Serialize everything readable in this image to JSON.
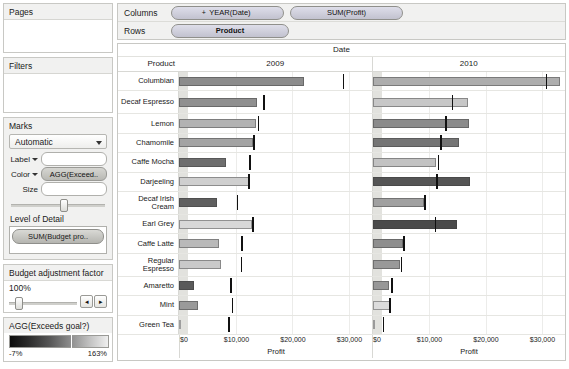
{
  "sidebar": {
    "pages": {
      "title": "Pages"
    },
    "filters": {
      "title": "Filters"
    },
    "marks": {
      "title": "Marks",
      "mark_type": "Automatic",
      "label_shelf_label": "Label",
      "label_shelf_value": "",
      "color_shelf_label": "Color",
      "color_shelf_value": "AGG(Exceed..",
      "size_shelf_label": "Size",
      "size_shelf_value": "",
      "level_of_detail_title": "Level of Detail",
      "level_of_detail_pill": "SUM(Budget pro.."
    },
    "parameter": {
      "title": "Budget adjustment factor",
      "value": "100%",
      "prev_label": "◂",
      "next_label": "▸"
    },
    "legend": {
      "title": "AGG(Exceeds goal?)",
      "min": "-7%",
      "max": "163%",
      "gradient_dark": "#0d0d0d",
      "gradient_light": "#efefef"
    }
  },
  "shelves": {
    "columns_label": "Columns",
    "columns_pills": [
      "YEAR(Date)",
      "SUM(Profit)"
    ],
    "columns_pill_plus": "+",
    "rows_label": "Rows",
    "rows_pills": [
      "Product"
    ]
  },
  "chart_data": {
    "type": "bar",
    "title": "",
    "date_header": "Date",
    "row_field_header": "Product",
    "panels": [
      "2009",
      "2010"
    ],
    "xlabel": "Profit",
    "ylabel": "Product",
    "xlim": [
      0,
      34000
    ],
    "xticks": [
      0,
      10000,
      20000,
      30000
    ],
    "xticklabels": [
      "$0",
      "$10,000",
      "$20,000",
      "$30,000"
    ],
    "grid": true,
    "legend_position": "left-panel",
    "categories": [
      "Columbian",
      "Decaf Espresso",
      "Lemon",
      "Chamomile",
      "Caffe Mocha",
      "Darjeeling",
      "Decaf Irish Cream",
      "Earl Grey",
      "Caffe Latte",
      "Regular Espresso",
      "Amaretto",
      "Mint",
      "Green Tea"
    ],
    "series": [
      {
        "name": "2009",
        "measure": "SUM(Profit)",
        "values": [
          22100,
          13800,
          13600,
          13000,
          8300,
          12500,
          6700,
          12900,
          7100,
          7400,
          2600,
          3300,
          300
        ],
        "reference_lines": [
          28900,
          14900,
          13900,
          13100,
          12400,
          12200,
          10200,
          12900,
          11000,
          10900,
          9000,
          9300,
          8700
        ],
        "colors": [
          "#8c8c8c",
          "#8f8f8f",
          "#b2b2b2",
          "#a3a3a3",
          "#6e6e6e",
          "#cfcfcf",
          "#5f5f5f",
          "#d8d8d8",
          "#b9b9b9",
          "#c9c9c9",
          "#5a5a5a",
          "#9a9a9a",
          "#efefef"
        ]
      },
      {
        "name": "2010",
        "measure": "SUM(Profit)",
        "values": [
          33200,
          16900,
          17000,
          15300,
          11200,
          17200,
          9100,
          14900,
          5300,
          4800,
          2900,
          3100,
          200
        ],
        "reference_lines": [
          30600,
          14000,
          12800,
          12000,
          11500,
          11300,
          9100,
          11000,
          5400,
          5000,
          3300,
          3000,
          1800
        ],
        "colors": [
          "#adadad",
          "#c7c7c7",
          "#8b8b8b",
          "#757575",
          "#c2c2c2",
          "#555555",
          "#a0a0a0",
          "#4a4a4a",
          "#8e8e8e",
          "#999999",
          "#979797",
          "#dcdcdc",
          "#e8e8e8"
        ]
      }
    ]
  }
}
